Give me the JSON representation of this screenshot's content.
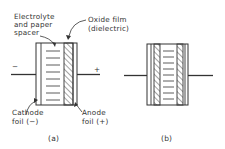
{
  "diagram_a": {
    "labels": {
      "electrolyte_line1": "Electrolyte",
      "electrolyte_line2": "and paper",
      "electrolyte_line3": "spacer",
      "oxide_line1": "Oxide film",
      "oxide_line2": "(dielectric)",
      "cathode_line1": "Cathode",
      "cathode_line2": "foil (−)",
      "anode_line1": "Anode",
      "anode_line2": "foil (+)",
      "minus": "−",
      "plus": "+",
      "caption": "(a)"
    }
  },
  "diagram_b": {
    "labels": {
      "caption": "(b)"
    }
  },
  "colors": {
    "stroke": "#333333",
    "background": "#ffffff"
  }
}
